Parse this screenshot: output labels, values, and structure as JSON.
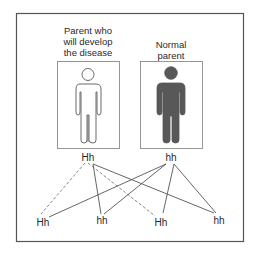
{
  "diagram": {
    "parents": [
      {
        "id": "affected",
        "label_lines": [
          "Parent who",
          "will develop",
          "the disease"
        ],
        "genotype": "Hh",
        "figure_style": "outline"
      },
      {
        "id": "normal",
        "label_lines": [
          "Normal",
          "parent"
        ],
        "genotype": "hh",
        "figure_style": "filled"
      }
    ],
    "children": [
      {
        "genotype": "Hh"
      },
      {
        "genotype": "hh"
      },
      {
        "genotype": "Hh"
      },
      {
        "genotype": "hh"
      }
    ],
    "edges": [
      {
        "from": "affected",
        "to_child": 0,
        "style": "dashed",
        "allele": "H"
      },
      {
        "from": "affected",
        "to_child": 2,
        "style": "dashed",
        "allele": "H"
      },
      {
        "from": "affected",
        "to_child": 1,
        "style": "solid",
        "allele": "h"
      },
      {
        "from": "affected",
        "to_child": 3,
        "style": "solid",
        "allele": "h"
      },
      {
        "from": "normal",
        "to_child": 0,
        "style": "solid",
        "allele": "h"
      },
      {
        "from": "normal",
        "to_child": 1,
        "style": "solid",
        "allele": "h"
      },
      {
        "from": "normal",
        "to_child": 2,
        "style": "solid",
        "allele": "h"
      },
      {
        "from": "normal",
        "to_child": 3,
        "style": "solid",
        "allele": "h"
      }
    ],
    "colors": {
      "frame": "#555555",
      "inner_frame": "#8a8a8a",
      "outline_figure": "#6a6a6a",
      "filled_figure": "#585858",
      "edge": "#555555",
      "edge_dashed": "#7a7a7a",
      "text": "#2a2a2a"
    }
  }
}
